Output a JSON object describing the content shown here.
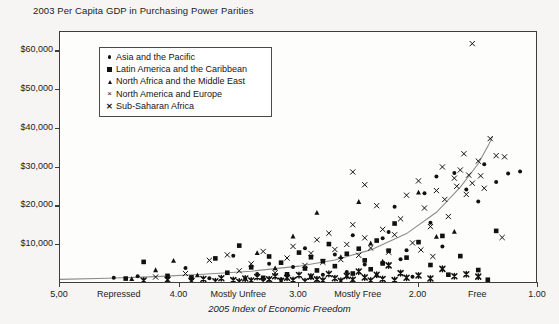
{
  "chart_data": {
    "type": "scatter",
    "title": "2003 Per Capita GDP in Purchasing Power Parities",
    "xlabel": "2005 Index of Economic Freedom",
    "ylabel": "",
    "xlim": [
      5.0,
      1.0
    ],
    "ylim": [
      0,
      65000
    ],
    "x_axis_inverted": true,
    "grid": false,
    "legend_position": "top-left inside plot",
    "y_ticks": [
      {
        "value": 10000,
        "label": "$10,000"
      },
      {
        "value": 20000,
        "label": "$20,000"
      },
      {
        "value": 30000,
        "label": "$30,000"
      },
      {
        "value": 40000,
        "label": "$40,000"
      },
      {
        "value": 50000,
        "label": "$50,000"
      },
      {
        "value": 60000,
        "label": "$60,000"
      }
    ],
    "x_ticks": [
      {
        "value": 5.0,
        "label": "5,00",
        "type": "numeric"
      },
      {
        "value": 4.5,
        "label": "Repressed",
        "type": "category"
      },
      {
        "value": 4.0,
        "label": "4.00",
        "type": "numeric"
      },
      {
        "value": 3.5,
        "label": "Mostly Unfree",
        "type": "category"
      },
      {
        "value": 3.0,
        "label": "3.00",
        "type": "numeric"
      },
      {
        "value": 2.5,
        "label": "Mostly Free",
        "type": "category"
      },
      {
        "value": 2.0,
        "label": "2.00",
        "type": "numeric"
      },
      {
        "value": 1.5,
        "label": "Free",
        "type": "category"
      },
      {
        "value": 1.0,
        "label": "1.00",
        "type": "numeric"
      }
    ],
    "x_tick_marks": [
      5.0,
      4.0,
      3.0,
      2.0,
      1.0
    ],
    "trendline": {
      "color": "#8c8c8c",
      "description": "exponential fit rising toward greater economic freedom",
      "points": [
        [
          5.0,
          1200
        ],
        [
          4.6,
          1500
        ],
        [
          4.2,
          1900
        ],
        [
          3.8,
          2500
        ],
        [
          3.4,
          3300
        ],
        [
          3.0,
          4600
        ],
        [
          2.7,
          6200
        ],
        [
          2.4,
          8800
        ],
        [
          2.1,
          13000
        ],
        [
          1.85,
          18500
        ],
        [
          1.65,
          25000
        ],
        [
          1.5,
          31000
        ],
        [
          1.42,
          35500
        ],
        [
          1.38,
          38000
        ]
      ]
    },
    "series": [
      {
        "name": "Asia and the Pacific",
        "marker": "dot",
        "color": "#111111",
        "points": [
          [
            4.55,
            1600
          ],
          [
            4.35,
            2000
          ],
          [
            3.95,
            4100
          ],
          [
            3.75,
            1500
          ],
          [
            3.55,
            7300
          ],
          [
            3.45,
            1400
          ],
          [
            3.35,
            2600
          ],
          [
            3.25,
            5200
          ],
          [
            3.15,
            1200
          ],
          [
            3.05,
            4400
          ],
          [
            2.95,
            9200
          ],
          [
            2.9,
            1800
          ],
          [
            2.8,
            2400
          ],
          [
            2.7,
            7600
          ],
          [
            2.6,
            3100
          ],
          [
            2.55,
            12600
          ],
          [
            2.45,
            5000
          ],
          [
            2.35,
            2200
          ],
          [
            2.3,
            11800
          ],
          [
            2.2,
            19900
          ],
          [
            2.1,
            8700
          ],
          [
            2.05,
            1900
          ],
          [
            1.95,
            23400
          ],
          [
            1.9,
            15800
          ],
          [
            1.85,
            27700
          ],
          [
            1.8,
            9700
          ],
          [
            1.7,
            28600
          ],
          [
            1.6,
            24400
          ],
          [
            1.5,
            21300
          ],
          [
            1.45,
            30900
          ],
          [
            1.35,
            26300
          ],
          [
            1.25,
            28500
          ],
          [
            1.15,
            29000
          ],
          [
            2.25,
            13400
          ],
          [
            2.15,
            6400
          ]
        ]
      },
      {
        "name": "Latin America and the Caribbean",
        "marker": "square",
        "color": "#111111",
        "points": [
          [
            4.45,
            1400
          ],
          [
            4.3,
            5700
          ],
          [
            4.1,
            2100
          ],
          [
            3.9,
            1700
          ],
          [
            3.7,
            6600
          ],
          [
            3.6,
            2900
          ],
          [
            3.5,
            9900
          ],
          [
            3.4,
            4300
          ],
          [
            3.3,
            1600
          ],
          [
            3.25,
            7100
          ],
          [
            3.15,
            5500
          ],
          [
            3.1,
            2500
          ],
          [
            3.0,
            8100
          ],
          [
            2.95,
            4000
          ],
          [
            2.9,
            6900
          ],
          [
            2.85,
            3500
          ],
          [
            2.8,
            5900
          ],
          [
            2.75,
            10300
          ],
          [
            2.7,
            4600
          ],
          [
            2.6,
            7800
          ],
          [
            2.55,
            2700
          ],
          [
            2.5,
            9100
          ],
          [
            2.45,
            6100
          ],
          [
            2.4,
            3800
          ],
          [
            2.35,
            11200
          ],
          [
            2.3,
            5300
          ],
          [
            2.25,
            8600
          ],
          [
            2.2,
            15600
          ],
          [
            2.1,
            6800
          ],
          [
            2.0,
            10800
          ],
          [
            1.9,
            4900
          ],
          [
            1.8,
            12400
          ],
          [
            1.75,
            2400
          ],
          [
            1.65,
            7200
          ],
          [
            1.5,
            3600
          ],
          [
            1.42,
            1100
          ],
          [
            1.35,
            13700
          ]
        ]
      },
      {
        "name": "North Africa and the Middle East",
        "marker": "triangle",
        "color": "#111111",
        "points": [
          [
            4.4,
            1300
          ],
          [
            4.2,
            3600
          ],
          [
            4.05,
            6000
          ],
          [
            3.85,
            2300
          ],
          [
            3.35,
            8000
          ],
          [
            3.2,
            4100
          ],
          [
            3.05,
            12300
          ],
          [
            2.85,
            18400
          ],
          [
            2.65,
            7000
          ],
          [
            2.5,
            21200
          ],
          [
            2.4,
            10500
          ],
          [
            2.3,
            5800
          ],
          [
            2.0,
            23600
          ],
          [
            1.85,
            12200
          ],
          [
            1.7,
            13500
          ]
        ]
      },
      {
        "name": "North America and Europe",
        "marker": "x",
        "color": "#111111",
        "points": [
          [
            4.2,
            1800
          ],
          [
            3.95,
            2700
          ],
          [
            3.75,
            6100
          ],
          [
            3.6,
            7500
          ],
          [
            3.5,
            3400
          ],
          [
            3.4,
            5200
          ],
          [
            3.3,
            8400
          ],
          [
            3.2,
            2900
          ],
          [
            3.1,
            6700
          ],
          [
            3.05,
            9700
          ],
          [
            2.95,
            4800
          ],
          [
            2.9,
            7900
          ],
          [
            2.85,
            11400
          ],
          [
            2.8,
            5600
          ],
          [
            2.75,
            13100
          ],
          [
            2.7,
            8900
          ],
          [
            2.65,
            6300
          ],
          [
            2.6,
            10200
          ],
          [
            2.55,
            15300
          ],
          [
            2.5,
            7400
          ],
          [
            2.45,
            11900
          ],
          [
            2.4,
            9300
          ],
          [
            2.35,
            20200
          ],
          [
            2.3,
            14100
          ],
          [
            2.25,
            8200
          ],
          [
            2.2,
            12700
          ],
          [
            2.15,
            16800
          ],
          [
            2.1,
            22900
          ],
          [
            2.05,
            10600
          ],
          [
            2.0,
            26600
          ],
          [
            1.95,
            19600
          ],
          [
            1.9,
            14800
          ],
          [
            1.85,
            24100
          ],
          [
            1.8,
            30200
          ],
          [
            1.78,
            21800
          ],
          [
            1.75,
            17400
          ],
          [
            1.7,
            27300
          ],
          [
            1.68,
            25200
          ],
          [
            1.65,
            29400
          ],
          [
            1.62,
            33600
          ],
          [
            1.6,
            23100
          ],
          [
            1.58,
            28100
          ],
          [
            1.55,
            26000
          ],
          [
            1.5,
            31700
          ],
          [
            1.48,
            27900
          ],
          [
            1.45,
            24700
          ],
          [
            1.4,
            37500
          ],
          [
            1.35,
            33100
          ],
          [
            1.3,
            12000
          ],
          [
            1.28,
            32800
          ],
          [
            1.55,
            62000
          ],
          [
            2.55,
            28900
          ],
          [
            2.45,
            25600
          ],
          [
            1.98,
            8800
          ],
          [
            1.88,
            7100
          ]
        ]
      },
      {
        "name": "Sub-Saharan Africa",
        "marker": "star",
        "color": "#111111",
        "points": [
          [
            4.3,
            900
          ],
          [
            4.1,
            1100
          ],
          [
            3.9,
            800
          ],
          [
            3.8,
            1300
          ],
          [
            3.7,
            700
          ],
          [
            3.65,
            1500
          ],
          [
            3.55,
            1000
          ],
          [
            3.5,
            600
          ],
          [
            3.45,
            1400
          ],
          [
            3.4,
            900
          ],
          [
            3.35,
            1800
          ],
          [
            3.3,
            700
          ],
          [
            3.25,
            1200
          ],
          [
            3.2,
            2000
          ],
          [
            3.15,
            800
          ],
          [
            3.1,
            1600
          ],
          [
            3.05,
            1000
          ],
          [
            3.0,
            2300
          ],
          [
            2.95,
            700
          ],
          [
            2.9,
            1900
          ],
          [
            2.85,
            1200
          ],
          [
            2.8,
            900
          ],
          [
            2.75,
            2600
          ],
          [
            2.7,
            1500
          ],
          [
            2.65,
            800
          ],
          [
            2.6,
            2100
          ],
          [
            2.55,
            1100
          ],
          [
            2.5,
            3200
          ],
          [
            2.45,
            1700
          ],
          [
            2.4,
            900
          ],
          [
            2.35,
            2400
          ],
          [
            2.3,
            1300
          ],
          [
            2.25,
            4800
          ],
          [
            2.2,
            1000
          ],
          [
            2.15,
            2800
          ],
          [
            2.1,
            1600
          ],
          [
            2.0,
            2200
          ],
          [
            1.9,
            1400
          ],
          [
            1.8,
            3900
          ],
          [
            1.7,
            2000
          ],
          [
            1.6,
            2500
          ],
          [
            1.5,
            1900
          ]
        ]
      }
    ]
  },
  "title": "2003 Per Capita GDP in Purchasing Power Parities",
  "axis": {
    "x_title": "2005 Index of Economic Freedom"
  },
  "legend": {
    "items": [
      {
        "label": "Asia and the Pacific",
        "marker": "dot"
      },
      {
        "label": "Latin America and the Caribbean",
        "marker": "square"
      },
      {
        "label": "North Africa and the Middle East",
        "marker": "triangle"
      },
      {
        "label": "North America and Europe",
        "marker": "x"
      },
      {
        "label": "Sub-Saharan Africa",
        "marker": "star"
      }
    ]
  }
}
